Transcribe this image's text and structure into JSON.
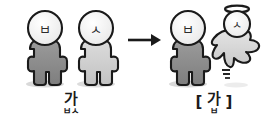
{
  "diagram": {
    "background_color": "#ffffff",
    "ink_color": "#1a1a1a",
    "arrow": {
      "name": "rightwards-arrow",
      "symbol": "→"
    },
    "left_group": {
      "label_main": "가",
      "label_sub": "ㅂㅅ",
      "label_reading": "값",
      "figures": [
        {
          "head_glyph": "ㅂ",
          "body_fill": "#8f8f8f",
          "head_fill": "#f2f2f2",
          "state": "alive"
        },
        {
          "head_glyph": "ㅅ",
          "body_fill": "#cfcfcf",
          "head_fill": "#f7f7f7",
          "state": "alive"
        }
      ]
    },
    "right_group": {
      "label_open_bracket": "[",
      "label_close_bracket": "]",
      "label_main": "가",
      "label_sub": "ㅂ",
      "label_reading": "[갑]",
      "figures": [
        {
          "head_glyph": "ㅂ",
          "body_fill": "#8f8f8f",
          "head_fill": "#f2f2f2",
          "state": "alive"
        },
        {
          "head_glyph": "ㅅ",
          "body_fill": "#d8d8d8",
          "head_fill": "#f7f7f7",
          "state": "ghost",
          "has_halo": true,
          "motion_marks": 3
        }
      ]
    },
    "shadow_fill": "#d9d9d9"
  }
}
